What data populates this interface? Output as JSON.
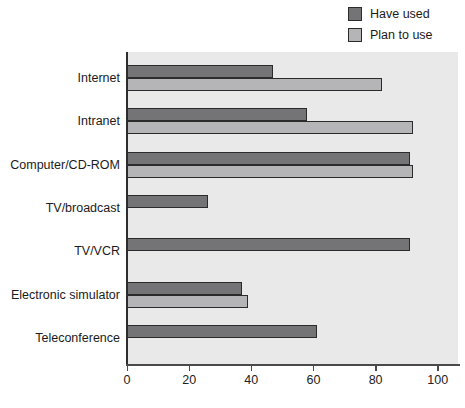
{
  "legend": {
    "items": [
      {
        "label": "Have used",
        "color": "#747477",
        "border": "#2b2b2b"
      },
      {
        "label": "Plan to use",
        "color": "#b5b5b7",
        "border": "#2b2b2b"
      }
    ]
  },
  "chart_data": {
    "type": "bar",
    "orientation": "horizontal",
    "title": "",
    "xlabel": "",
    "ylabel": "",
    "categories": [
      "Internet",
      "Intranet",
      "Computer/CD-ROM",
      "TV/broadcast",
      "TV/VCR",
      "Electronic simulator",
      "Teleconference"
    ],
    "series": [
      {
        "name": "Have used",
        "color": "#747477",
        "values": [
          47,
          58,
          91,
          26,
          91,
          37,
          61
        ]
      },
      {
        "name": "Plan to use",
        "color": "#b5b5b7",
        "values": [
          82,
          92,
          92,
          null,
          null,
          39,
          null
        ]
      }
    ],
    "xticks": [
      "0",
      "20",
      "40",
      "60",
      "80",
      "100"
    ],
    "xtick_values": [
      0,
      20,
      40,
      60,
      80,
      100
    ],
    "xlim": [
      0,
      106.5
    ],
    "grid": false,
    "legend_position": "top-right",
    "plot_background": "#e9e9e9",
    "bar_border_color": "#2b2b2b"
  }
}
